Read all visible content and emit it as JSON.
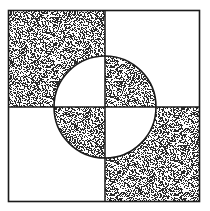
{
  "figure": {
    "title": "Quadrant square with inverted central circle",
    "canvas": {
      "width": 210,
      "height": 211,
      "background_color": "#ffffff"
    },
    "outer_square": {
      "name": "outer-square",
      "x": 8.5,
      "y": 10.5,
      "width": 191,
      "height": 191,
      "stroke_color": "#1a1a1a",
      "stroke_width": 1.6,
      "fill": "none"
    },
    "divider_lines": [
      {
        "name": "vertical-divider",
        "orientation": "vertical",
        "x1": 105,
        "y1": 10.5,
        "x2": 105,
        "y2": 201.5,
        "stroke_color": "#1a1a1a",
        "stroke_width": 1.5
      },
      {
        "name": "horizontal-divider",
        "orientation": "horizontal",
        "x1": 8.5,
        "y1": 107,
        "x2": 199.5,
        "y2": 107,
        "stroke_color": "#1a1a1a",
        "stroke_width": 1.5
      }
    ],
    "circle": {
      "name": "center-circle",
      "cx": 105,
      "cy": 107,
      "r": 51,
      "stroke_color": "#1a1a1a",
      "stroke_width": 1.6,
      "fill": "none"
    },
    "stipple": {
      "color": "#2b2b2b",
      "background_color": "#ffffff",
      "density_percent": 46,
      "dot_size_px": 1,
      "tile_size_px": 64
    },
    "quadrants": [
      {
        "name": "quadrant-top-left",
        "position": "top-left",
        "outside_circle_fill": "stipple",
        "inside_circle_fill": "white"
      },
      {
        "name": "quadrant-top-right",
        "position": "top-right",
        "outside_circle_fill": "white",
        "inside_circle_fill": "stipple"
      },
      {
        "name": "quadrant-bottom-left",
        "position": "bottom-left",
        "outside_circle_fill": "white",
        "inside_circle_fill": "stipple"
      },
      {
        "name": "quadrant-bottom-right",
        "position": "bottom-right",
        "outside_circle_fill": "stipple",
        "inside_circle_fill": "white"
      }
    ]
  }
}
